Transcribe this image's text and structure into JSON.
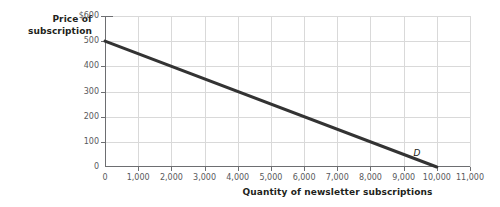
{
  "chart_data": {
    "type": "line",
    "title": "",
    "xlabel": "Quantity of newsletter subscriptions",
    "ylabel": "Price of subscription",
    "ylabel_line1": "Price of",
    "ylabel_line2": "subscription",
    "xlim": [
      0,
      11000
    ],
    "ylim": [
      0,
      600
    ],
    "grid": true,
    "legend_position": "inline-curve-label",
    "x_ticks": [
      {
        "value": 0,
        "label": "0"
      },
      {
        "value": 1000,
        "label": "1,000"
      },
      {
        "value": 2000,
        "label": "2,000"
      },
      {
        "value": 3000,
        "label": "3,000"
      },
      {
        "value": 4000,
        "label": "4,000"
      },
      {
        "value": 5000,
        "label": "5,000"
      },
      {
        "value": 6000,
        "label": "6,000"
      },
      {
        "value": 7000,
        "label": "7,000"
      },
      {
        "value": 8000,
        "label": "8,000"
      },
      {
        "value": 9000,
        "label": "9,000"
      },
      {
        "value": 10000,
        "label": "10,000"
      },
      {
        "value": 11000,
        "label": "11,000"
      }
    ],
    "y_ticks": [
      {
        "value": 600,
        "label": "$600"
      },
      {
        "value": 500,
        "label": "500"
      },
      {
        "value": 400,
        "label": "400"
      },
      {
        "value": 300,
        "label": "300"
      },
      {
        "value": 200,
        "label": "200"
      },
      {
        "value": 100,
        "label": "100"
      },
      {
        "value": 0,
        "label": "0"
      }
    ],
    "series": [
      {
        "name": "D",
        "label": "D",
        "kind": "demand-curve",
        "color": "#333333",
        "x": [
          0,
          10000
        ],
        "y": [
          500,
          0
        ],
        "points": [
          {
            "x": 0,
            "y": 500
          },
          {
            "x": 1000,
            "y": 450
          },
          {
            "x": 2000,
            "y": 400
          },
          {
            "x": 3000,
            "y": 350
          },
          {
            "x": 4000,
            "y": 300
          },
          {
            "x": 5000,
            "y": 250
          },
          {
            "x": 6000,
            "y": 200
          },
          {
            "x": 7000,
            "y": 150
          },
          {
            "x": 8000,
            "y": 100
          },
          {
            "x": 9000,
            "y": 50
          },
          {
            "x": 10000,
            "y": 0
          }
        ],
        "slope": -0.05,
        "intercept": 500
      }
    ],
    "annotations": [
      {
        "text": "D",
        "x": 9300,
        "y": 55,
        "style": "italic"
      }
    ],
    "colors": {
      "curve": "#333333",
      "grid": "#d9d9d9",
      "axis": "#6d6e71",
      "tick_text": "#58595b",
      "title_text": "#231f20",
      "background": "#ffffff"
    }
  }
}
